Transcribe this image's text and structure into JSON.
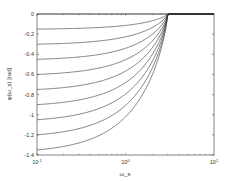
{
  "chart_data": {
    "type": "line",
    "title": "",
    "xlabel": "ω_s",
    "ylabel": "φ(ω_s) [rad]",
    "xscale": "log",
    "xlim": [
      0.1,
      10
    ],
    "ylim": [
      -1.4,
      0
    ],
    "grid": false,
    "legend": null,
    "x_ticks": [
      {
        "value": 0.1,
        "base": "10",
        "exp": "-1"
      },
      {
        "value": 1,
        "base": "10",
        "exp": "0"
      },
      {
        "value": 10,
        "base": "10",
        "exp": "1"
      }
    ],
    "y_ticks": [
      {
        "value": 0,
        "label": "0"
      },
      {
        "value": -0.2,
        "label": "-0.2"
      },
      {
        "value": -0.4,
        "label": "-0.4"
      },
      {
        "value": -0.6,
        "label": "-0.6"
      },
      {
        "value": -0.8,
        "label": "-0.8"
      },
      {
        "value": -1,
        "label": "-1"
      },
      {
        "value": -1.2,
        "label": "-1.2"
      },
      {
        "value": -1.4,
        "label": "-1.4"
      }
    ],
    "convergence_x": 3,
    "series": [
      {
        "name": "curve-0",
        "value_at_x_min": 0
      },
      {
        "name": "curve-1",
        "value_at_x_min": -0.15
      },
      {
        "name": "curve-2",
        "value_at_x_min": -0.3
      },
      {
        "name": "curve-3",
        "value_at_x_min": -0.45
      },
      {
        "name": "curve-4",
        "value_at_x_min": -0.6
      },
      {
        "name": "curve-5",
        "value_at_x_min": -0.75
      },
      {
        "name": "curve-6",
        "value_at_x_min": -0.9
      },
      {
        "name": "curve-7",
        "value_at_x_min": -1.05
      },
      {
        "name": "curve-8",
        "value_at_x_min": -1.2
      },
      {
        "name": "curve-9",
        "value_at_x_min": -1.35
      }
    ],
    "line_color": "#333333"
  }
}
